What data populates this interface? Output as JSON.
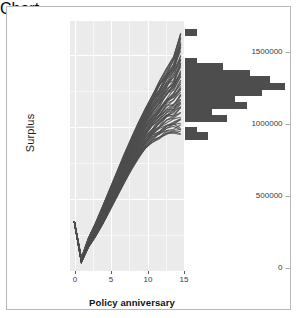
{
  "chart_data": {
    "type": "line",
    "title": "",
    "xlabel": "Policy anniversary",
    "ylabel": "Surplus",
    "xlim": [
      -0.6,
      15.6
    ],
    "ylim": [
      -120000,
      1620000
    ],
    "xticks": [
      0,
      5,
      10,
      15
    ],
    "xtick_labels": [
      "0",
      "5",
      "10",
      "15"
    ],
    "yticks": [
      0,
      500000,
      1000000,
      1500000
    ],
    "ytick_labels": [
      "0",
      "500000",
      "1000000",
      "1500000"
    ],
    "grid": true,
    "panel_background": "#ebebeb",
    "line_color": "#4d4d4d",
    "series_note": "Many overlapping simulated surplus paths (spaghetti plot): each path starts near 225000 at anniversary 0, drops to about -60000 at anniversary 1, then rises steadily to a fan of terminal values between roughly 830000 and 1540000 at anniversary 15.",
    "envelope": {
      "x": [
        0,
        1,
        2,
        3,
        4,
        5,
        6,
        7,
        8,
        9,
        10,
        11,
        12,
        13,
        14,
        15
      ],
      "upper": [
        225000,
        -30000,
        110000,
        215000,
        330000,
        450000,
        570000,
        690000,
        800000,
        910000,
        1010000,
        1110000,
        1200000,
        1290000,
        1370000,
        1540000
      ],
      "lower": [
        225000,
        -60000,
        45000,
        120000,
        205000,
        300000,
        395000,
        490000,
        580000,
        660000,
        730000,
        770000,
        800000,
        830000,
        835000,
        830000
      ]
    },
    "histogram": {
      "orientation": "horizontal",
      "position": "right of panel at final anniversary",
      "bar_color": "#4d4d4d",
      "bin_centers": [
        1540000,
        1340000,
        1300000,
        1255000,
        1210000,
        1165000,
        1120000,
        1075000,
        1030000,
        985000,
        940000,
        860000,
        820000
      ],
      "counts": [
        3,
        3,
        10,
        17,
        22,
        26,
        20,
        13,
        16,
        7,
        11,
        3,
        6
      ],
      "max_count": 26
    }
  },
  "axes": {
    "y_title": "Surplus",
    "x_title": "Policy anniversary"
  }
}
